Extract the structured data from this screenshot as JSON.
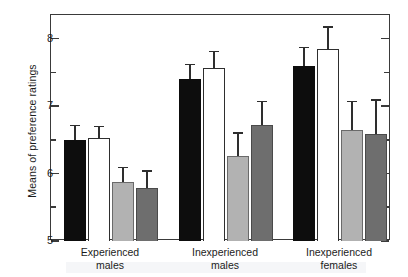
{
  "chart_data": {
    "type": "bar",
    "title": "",
    "subtitle": "",
    "xlabel": "",
    "ylabel": "Means of preference ratings",
    "ylim": [
      5,
      8.35
    ],
    "yticks_major": [
      5,
      6,
      7,
      8
    ],
    "yticks_minor": [
      5.5,
      6.5,
      7.5
    ],
    "ytick_labels": [
      "5",
      "6",
      "7",
      "8"
    ],
    "grid": false,
    "legend_position": "none",
    "categories": [
      "Experienced males",
      "Inexperienced males",
      "Inexperienced females"
    ],
    "category_lines": [
      [
        "Experienced",
        "males"
      ],
      [
        "Inexperienced",
        "males"
      ],
      [
        "Inexperienced",
        "females"
      ]
    ],
    "series": [
      {
        "name": "series-1",
        "swatch": "black",
        "color": "#0d0d0d",
        "values": [
          6.5,
          7.4,
          7.6
        ],
        "errors": [
          0.22,
          0.23,
          0.28
        ]
      },
      {
        "name": "series-2",
        "swatch": "white",
        "color": "#ffffff",
        "values": [
          6.52,
          7.57,
          7.85
        ],
        "errors": [
          0.19,
          0.25,
          0.33
        ]
      },
      {
        "name": "series-3",
        "swatch": "light-gray",
        "color": "#b2b2b2",
        "values": [
          5.87,
          6.26,
          6.65
        ],
        "errors": [
          0.23,
          0.35,
          0.43
        ]
      },
      {
        "name": "series-4",
        "swatch": "dark-gray",
        "color": "#6e6e6e",
        "values": [
          5.79,
          6.72,
          6.58
        ],
        "errors": [
          0.26,
          0.36,
          0.52
        ]
      }
    ]
  },
  "axis": {
    "y_title": "Means of preference ratings"
  }
}
